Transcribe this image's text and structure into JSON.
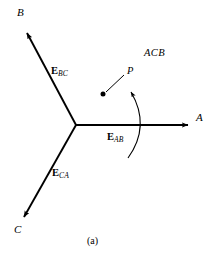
{
  "figure": {
    "caption": "(a)",
    "sequence_label": "ACB",
    "point_label": "P",
    "background_color": "#ffffff",
    "line_color": "#000000"
  },
  "terminals": [
    {
      "name": "A",
      "label": "A",
      "x": 198,
      "y": 117,
      "tip_x": 191,
      "tip_y": 125
    },
    {
      "name": "B",
      "label": "B",
      "x": 18,
      "y": 9,
      "tip_x": 24,
      "tip_y": 28
    },
    {
      "name": "C",
      "label": "C",
      "x": 15,
      "y": 226,
      "tip_x": 21,
      "tip_y": 222
    }
  ],
  "phasors": [
    {
      "name": "E-AB",
      "symbol": "E",
      "subscript": "AB",
      "x": 108,
      "y": 132
    },
    {
      "name": "E-BC",
      "symbol": "E",
      "subscript": "BC",
      "x": 52,
      "y": 66
    },
    {
      "name": "E-CA",
      "symbol": "E",
      "subscript": "CA",
      "x": 53,
      "y": 168
    }
  ],
  "geometry": {
    "origin": {
      "x": 76,
      "y": 125
    },
    "point_dot": {
      "x": 103,
      "y": 94
    },
    "point_leader_end": {
      "x": 125,
      "y": 75
    },
    "rotation_arc": {
      "start_x": 128,
      "start_y": 158,
      "ctrl_x": 150,
      "ctrl_y": 124,
      "end_x": 130,
      "end_y": 89
    }
  }
}
